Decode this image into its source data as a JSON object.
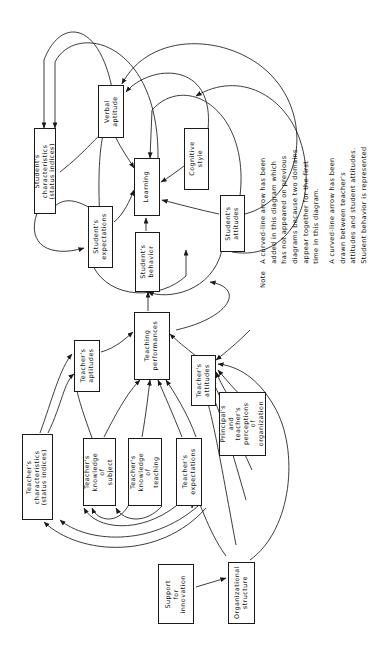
{
  "diagram": {
    "orientation": "rotated-90-ccw",
    "nodes": [
      {
        "id": "student_characteristics",
        "label": "Student's\ncharacteristics\n(status indices)"
      },
      {
        "id": "verbal_aptitude",
        "label": "Verbal\naptitude"
      },
      {
        "id": "learning",
        "label": "Learning"
      },
      {
        "id": "cognitive_style",
        "label": "Cognitive\nstyle"
      },
      {
        "id": "student_expectations",
        "label": "Student's\nexpectations"
      },
      {
        "id": "student_behavior",
        "label": "Student's\nbehavior"
      },
      {
        "id": "student_attitudes",
        "label": "Student's\nattitudes"
      },
      {
        "id": "teaching_performances",
        "label": "Teaching\nperformances"
      },
      {
        "id": "teacher_aptitudes",
        "label": "Teacher's\naptitudes"
      },
      {
        "id": "teacher_attitudes",
        "label": "Teacher's\nattitudes"
      },
      {
        "id": "principal_perceptions",
        "label": "Principal's\nand\nteacher's\nperceptions\nof\norganization"
      },
      {
        "id": "teacher_characteristics",
        "label": "Teacher's\ncharacteristics\n(status indices)"
      },
      {
        "id": "teacher_knowledge_subject",
        "label": "Teacher's\nknowledge\nof\nsubject"
      },
      {
        "id": "teacher_knowledge_teaching",
        "label": "Teacher's\nknowledge\nof\nteaching"
      },
      {
        "id": "teacher_expectations",
        "label": "Teacher's\nexpectations"
      },
      {
        "id": "support_innovation",
        "label": "Support\nfor\ninnovation"
      },
      {
        "id": "organizational_structure",
        "label": "Organizational\nstructure"
      }
    ]
  },
  "note": {
    "word": "Note",
    "paragraph_1": "A curved-line arrow has been\nadded in this diagram which\nhas not appeared on previous\ndiagrams because two domains\nappear together for the first\ntime in this diagram.",
    "paragraph_2": "A curved-line arrow has been\ndrawn between teacher's\nattitudes and student attitudes.\nStudent behavior is represented"
  },
  "colors": {
    "ink": "#1a1a1a",
    "background": "#ffffff"
  }
}
